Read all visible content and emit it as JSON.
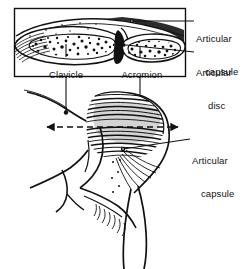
{
  "figure": {
    "style": "black-and-white line and stipple anatomical illustration",
    "background_color": "#ffffff",
    "ink_color": "#111111",
    "width": 243,
    "height": 269
  },
  "inset": {
    "name": "coronal-section-inset",
    "description": "boxed cross-section through the acromioclavicular joint",
    "border_color": "#111111",
    "box": {
      "x": 14,
      "y": 8,
      "width": 172,
      "height": 69
    }
  },
  "labels": [
    {
      "id": "articular-capsule-top",
      "line1": "Articular",
      "line2": "capsule",
      "x": 196,
      "y": 10,
      "align": "left",
      "target": "inset-superior-capsule"
    },
    {
      "id": "articular-disc",
      "line1": "Articular",
      "line2": "disc",
      "x": 196,
      "y": 45,
      "align": "left",
      "target": "inset-articular-disc"
    },
    {
      "id": "clavicle",
      "line1": "Clavicle",
      "line2": "",
      "x": 38,
      "y": 60,
      "align": "left",
      "target": "clavicle-bone"
    },
    {
      "id": "acromion",
      "line1": "Acromion",
      "line2": "",
      "x": 112,
      "y": 60,
      "align": "left",
      "target": "acromion-bone"
    },
    {
      "id": "articular-capsule-bottom",
      "line1": "Articular",
      "line2": "capsule",
      "x": 192,
      "y": 133,
      "align": "left",
      "target": "joint-capsule-surface"
    }
  ],
  "section_line": {
    "name": "section-plane-indicator",
    "style": "dashed with arrowheads at both ends",
    "x_start": 47,
    "x_end": 178,
    "y": 127
  },
  "leaders": [
    {
      "id": "clavicle-leader",
      "from_x": 66,
      "from_y": 66,
      "to_x": 66,
      "to_y": 112
    },
    {
      "id": "acromion-leader",
      "from_x": 140,
      "from_y": 66,
      "to_x": 140,
      "to_y": 110
    },
    {
      "id": "capsule-top-leader",
      "from_x": 186,
      "from_y": 21,
      "to_x": 132,
      "to_y": 21
    },
    {
      "id": "disc-leader",
      "from_x": 186,
      "from_y": 52,
      "to_x": 124,
      "to_y": 44
    },
    {
      "id": "capsule-bottom-leader",
      "from_x": 190,
      "from_y": 139,
      "to_x": 123,
      "to_y": 148
    }
  ],
  "anatomy_parts": [
    {
      "name": "clavicle-bone",
      "region": "inset-left",
      "texture": "cortical outline with cancellous stipple"
    },
    {
      "name": "acromion-bone",
      "region": "inset-right",
      "texture": "cortical outline with cancellous stipple"
    },
    {
      "name": "articular-disc-wedge",
      "region": "inset-center",
      "texture": "solid dark wedge"
    },
    {
      "name": "joint-capsule-hatching",
      "region": "main-drawing",
      "texture": "dense horizontal hatch lines"
    },
    {
      "name": "shoulder-contour",
      "region": "main-drawing",
      "texture": "line contour"
    },
    {
      "name": "neck-contour",
      "region": "main-drawing",
      "texture": "line contour"
    },
    {
      "name": "upper-arm-contour",
      "region": "main-drawing",
      "texture": "line contour"
    },
    {
      "name": "axilla-hatching",
      "region": "main-drawing",
      "texture": "short hatch strokes"
    }
  ]
}
